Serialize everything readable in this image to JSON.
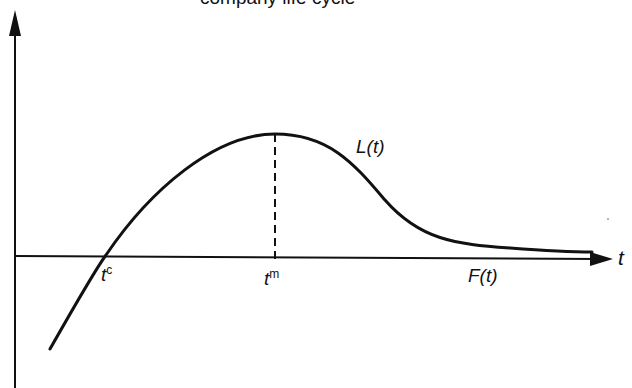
{
  "title_partial": "company life cycle",
  "axes": {
    "x_label": "t"
  },
  "curves": {
    "primary_label": "L(t)",
    "secondary_label": "F(t)"
  },
  "points": {
    "crossing": {
      "base": "t",
      "sup": "c"
    },
    "maximum": {
      "base": "t",
      "sup": "m"
    }
  },
  "colors": {
    "ink": "#111111",
    "background": "#ffffff"
  }
}
